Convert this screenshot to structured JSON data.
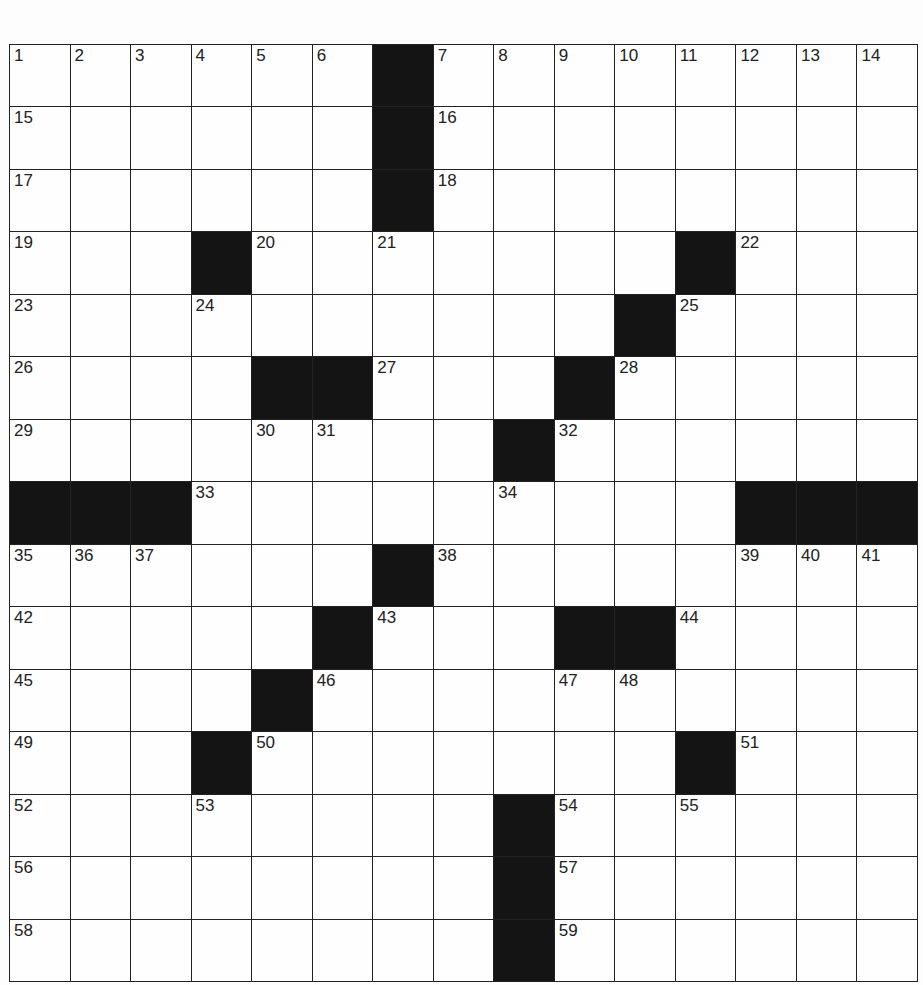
{
  "puzzle": {
    "rows": 15,
    "cols": 15,
    "colors": {
      "block": "#141414",
      "cell": "#fefefe",
      "line": "#222222"
    },
    "layout": [
      "......#........",
      "......#........",
      "......#........",
      "...#.......#...",
      "..........#....",
      "....##...#.....",
      "........#......",
      "###.........###",
      "......#........",
      ".....#...##....",
      "....#..........",
      "...#.......#...",
      "........#......",
      "........#......",
      "........#......"
    ],
    "numbers": [
      {
        "r": 0,
        "c": 0,
        "n": "1"
      },
      {
        "r": 0,
        "c": 1,
        "n": "2"
      },
      {
        "r": 0,
        "c": 2,
        "n": "3"
      },
      {
        "r": 0,
        "c": 3,
        "n": "4"
      },
      {
        "r": 0,
        "c": 4,
        "n": "5"
      },
      {
        "r": 0,
        "c": 5,
        "n": "6"
      },
      {
        "r": 0,
        "c": 7,
        "n": "7"
      },
      {
        "r": 0,
        "c": 8,
        "n": "8"
      },
      {
        "r": 0,
        "c": 9,
        "n": "9"
      },
      {
        "r": 0,
        "c": 10,
        "n": "10"
      },
      {
        "r": 0,
        "c": 11,
        "n": "11"
      },
      {
        "r": 0,
        "c": 12,
        "n": "12"
      },
      {
        "r": 0,
        "c": 13,
        "n": "13"
      },
      {
        "r": 0,
        "c": 14,
        "n": "14"
      },
      {
        "r": 1,
        "c": 0,
        "n": "15"
      },
      {
        "r": 1,
        "c": 7,
        "n": "16"
      },
      {
        "r": 2,
        "c": 0,
        "n": "17"
      },
      {
        "r": 2,
        "c": 7,
        "n": "18"
      },
      {
        "r": 3,
        "c": 0,
        "n": "19"
      },
      {
        "r": 3,
        "c": 4,
        "n": "20"
      },
      {
        "r": 3,
        "c": 6,
        "n": "21"
      },
      {
        "r": 3,
        "c": 12,
        "n": "22"
      },
      {
        "r": 4,
        "c": 0,
        "n": "23"
      },
      {
        "r": 4,
        "c": 3,
        "n": "24"
      },
      {
        "r": 4,
        "c": 11,
        "n": "25"
      },
      {
        "r": 5,
        "c": 0,
        "n": "26"
      },
      {
        "r": 5,
        "c": 6,
        "n": "27"
      },
      {
        "r": 5,
        "c": 10,
        "n": "28"
      },
      {
        "r": 6,
        "c": 0,
        "n": "29"
      },
      {
        "r": 6,
        "c": 4,
        "n": "30"
      },
      {
        "r": 6,
        "c": 5,
        "n": "31"
      },
      {
        "r": 6,
        "c": 9,
        "n": "32"
      },
      {
        "r": 7,
        "c": 3,
        "n": "33"
      },
      {
        "r": 7,
        "c": 8,
        "n": "34"
      },
      {
        "r": 8,
        "c": 0,
        "n": "35"
      },
      {
        "r": 8,
        "c": 1,
        "n": "36"
      },
      {
        "r": 8,
        "c": 2,
        "n": "37"
      },
      {
        "r": 8,
        "c": 7,
        "n": "38"
      },
      {
        "r": 8,
        "c": 12,
        "n": "39"
      },
      {
        "r": 8,
        "c": 13,
        "n": "40"
      },
      {
        "r": 8,
        "c": 14,
        "n": "41"
      },
      {
        "r": 9,
        "c": 0,
        "n": "42"
      },
      {
        "r": 9,
        "c": 6,
        "n": "43"
      },
      {
        "r": 9,
        "c": 11,
        "n": "44"
      },
      {
        "r": 10,
        "c": 0,
        "n": "45"
      },
      {
        "r": 10,
        "c": 5,
        "n": "46"
      },
      {
        "r": 10,
        "c": 9,
        "n": "47"
      },
      {
        "r": 10,
        "c": 10,
        "n": "48"
      },
      {
        "r": 11,
        "c": 0,
        "n": "49"
      },
      {
        "r": 11,
        "c": 4,
        "n": "50"
      },
      {
        "r": 11,
        "c": 12,
        "n": "51"
      },
      {
        "r": 12,
        "c": 0,
        "n": "52"
      },
      {
        "r": 12,
        "c": 3,
        "n": "53"
      },
      {
        "r": 12,
        "c": 9,
        "n": "54"
      },
      {
        "r": 12,
        "c": 11,
        "n": "55"
      },
      {
        "r": 13,
        "c": 0,
        "n": "56"
      },
      {
        "r": 13,
        "c": 9,
        "n": "57"
      },
      {
        "r": 14,
        "c": 0,
        "n": "58"
      },
      {
        "r": 14,
        "c": 9,
        "n": "59"
      }
    ]
  }
}
